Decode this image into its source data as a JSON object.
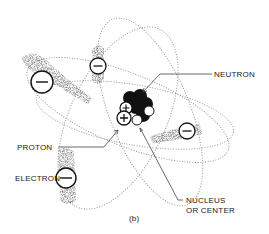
{
  "diagram": {
    "type": "atom-model",
    "caption": "(b)",
    "labels": {
      "neutron": "NEUTRON",
      "proton": "PROTON",
      "electron": "ELECTRON",
      "nucleus_line1": "NUCLEUS",
      "nucleus_line2": "OR CENTER"
    },
    "electrons": [
      {
        "symbol": "−",
        "x": 42,
        "y": 82,
        "r": 11
      },
      {
        "symbol": "−",
        "x": 98,
        "y": 66,
        "r": 8
      },
      {
        "symbol": "−",
        "x": 187,
        "y": 131,
        "r": 8
      },
      {
        "symbol": "−",
        "x": 66,
        "y": 178,
        "r": 10
      }
    ],
    "protons": [
      {
        "symbol": "+",
        "x": 126,
        "y": 108
      },
      {
        "symbol": "+",
        "x": 124,
        "y": 118
      }
    ],
    "colors": {
      "ink": "#111111",
      "orbit": "#9a9a9a",
      "background": "#ffffff"
    }
  }
}
